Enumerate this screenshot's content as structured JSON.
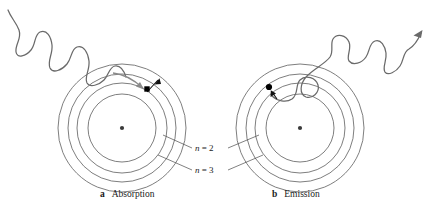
{
  "figure": {
    "type": "bohr-atom-photon-diagram",
    "background": "#ffffff",
    "stroke_color": "#5a5a5a",
    "accent_color": "#000000",
    "panels": [
      {
        "id": "absorption",
        "letter": "a",
        "caption": "Absorption",
        "caption_x": 105,
        "caption_y": 196,
        "center": [
          122,
          128
        ],
        "shell_radii": [
          34,
          45,
          54,
          64
        ],
        "electron": [
          148,
          90
        ],
        "photon_direction": "inbound",
        "electron_transition": "inward-to-outward"
      },
      {
        "id": "emission",
        "letter": "b",
        "caption": "Emission",
        "caption_x": 275,
        "caption_y": 196,
        "center": [
          300,
          128
        ],
        "shell_radii": [
          34,
          45,
          54,
          64
        ],
        "electron": [
          272,
          90
        ],
        "photon_direction": "outbound",
        "electron_transition": "outward-to-inward"
      }
    ],
    "orbit_labels": [
      {
        "text_n": "n",
        "text_eq": " = 2",
        "x": 196,
        "y": 150
      },
      {
        "text_n": "n",
        "text_eq": " = 3",
        "x": 196,
        "y": 172
      }
    ]
  }
}
